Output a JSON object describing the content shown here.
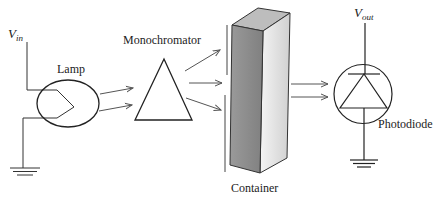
{
  "diagram": {
    "labels": {
      "vin_main": "V",
      "vin_sub": "in",
      "lamp": "Lamp",
      "monochromator": "Monochromator",
      "container": "Container",
      "vout_main": "V",
      "vout_sub": "out",
      "photodiode": "Photodiode"
    },
    "colors": {
      "stroke": "#333333",
      "arrow": "#555555",
      "box_front": "#8a8a8a",
      "box_side": "#e2e2e2",
      "box_top": "#bdbdbd"
    },
    "components": [
      "voltage-input",
      "lamp",
      "monochromator",
      "slit",
      "container",
      "photodiode",
      "voltage-output",
      "ground"
    ]
  }
}
